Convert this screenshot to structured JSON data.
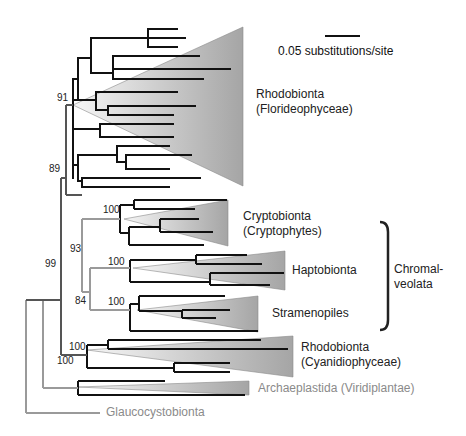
{
  "scale_bar": {
    "label": "0.05 substitutions/site"
  },
  "clades": [
    {
      "id": "floridrophyceae",
      "line1": "Rhodobionta",
      "line2": "(Florideophyceae)"
    },
    {
      "id": "cryptophytes",
      "line1": "Cryptobionta",
      "line2": "(Cryptophytes)"
    },
    {
      "id": "haptobionta",
      "line1": "Haptobionta"
    },
    {
      "id": "stramenopiles",
      "line1": "Stramenopiles"
    },
    {
      "id": "cyanidiophyceae",
      "line1": "Rhodobionta",
      "line2": "(Cyanidiophyceae)"
    },
    {
      "id": "viridiplantae",
      "line1": "Archaeplastida (Viridiplantae)"
    },
    {
      "id": "glaucocystobionta",
      "line1": "Glaucocystobionta"
    }
  ],
  "group_bracket": {
    "line1": "Chromal-",
    "line2": "veolata"
  },
  "bootstrap": {
    "rhodo_florid": "91",
    "rhodo_plus_chromal": "89",
    "crypto": "100",
    "chromal": "93",
    "hapto": "100",
    "hapto_strameno": "84",
    "strameno": "100",
    "cyanidio_a": "100",
    "cyanidio_b": "100",
    "root_node": "99"
  },
  "colors": {
    "branch_black": "#111111",
    "branch_gray": "#9a9a9a",
    "branch_dark_gray": "#555555",
    "triangle_fill_start": "#f4f4f4",
    "triangle_fill_end": "#a8a8a8"
  }
}
